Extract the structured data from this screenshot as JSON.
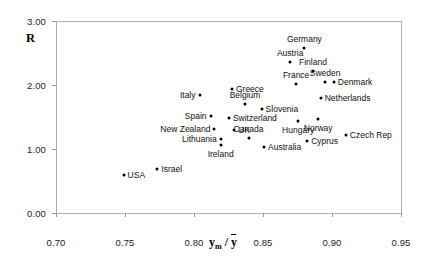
{
  "chart_data": {
    "type": "scatter",
    "title": "",
    "xlabel": "ym / ȳ",
    "ylabel": "R",
    "xlim": [
      0.7,
      0.95
    ],
    "ylim": [
      0.0,
      3.0
    ],
    "xticks": [
      "0.70",
      "0.75",
      "0.80",
      "0.85",
      "0.90",
      "0.95"
    ],
    "xtick_values": [
      0.7,
      0.75,
      0.8,
      0.85,
      0.9,
      0.95
    ],
    "yticks": [
      "0.00",
      "1.00",
      "2.00",
      "3.00"
    ],
    "ytick_values": [
      0.0,
      1.0,
      2.0,
      3.0
    ],
    "grid": false,
    "legend": "none",
    "marker": "filled-circle",
    "marker_color": "#000000",
    "frame_color": "#b0b0b0",
    "points": [
      {
        "name": "USA",
        "x": 0.749,
        "y": 0.59,
        "label_pos": "right"
      },
      {
        "name": "Israel",
        "x": 0.7735,
        "y": 0.69,
        "label_pos": "right"
      },
      {
        "name": "Italy",
        "x": 0.804,
        "y": 1.84,
        "label_pos": "left"
      },
      {
        "name": "Spain",
        "x": 0.812,
        "y": 1.51,
        "label_pos": "left"
      },
      {
        "name": "New Zealand",
        "x": 0.8148,
        "y": 1.31,
        "label_pos": "left"
      },
      {
        "name": "Lithuania",
        "x": 0.8193,
        "y": 1.15,
        "label_pos": "left"
      },
      {
        "name": "Ireland",
        "x": 0.8193,
        "y": 1.06,
        "label_pos": "below"
      },
      {
        "name": "Greece",
        "x": 0.8275,
        "y": 1.93,
        "label_pos": "right"
      },
      {
        "name": "Switzerland",
        "x": 0.8253,
        "y": 1.49,
        "label_pos": "right"
      },
      {
        "name": "UK",
        "x": 0.829,
        "y": 1.3,
        "label_pos": "right"
      },
      {
        "name": "Belgium",
        "x": 0.837,
        "y": 1.71,
        "label_pos": "above"
      },
      {
        "name": "Canada",
        "x": 0.8395,
        "y": 1.17,
        "label_pos": "above"
      },
      {
        "name": "Slovenia",
        "x": 0.849,
        "y": 1.62,
        "label_pos": "right"
      },
      {
        "name": "Australia",
        "x": 0.8508,
        "y": 1.03,
        "label_pos": "right"
      },
      {
        "name": "Austria",
        "x": 0.8697,
        "y": 2.36,
        "label_pos": "above"
      },
      {
        "name": "France",
        "x": 0.874,
        "y": 2.02,
        "label_pos": "above"
      },
      {
        "name": "Hungary",
        "x": 0.8755,
        "y": 1.44,
        "label_pos": "below"
      },
      {
        "name": "Germany",
        "x": 0.88,
        "y": 2.58,
        "label_pos": "above"
      },
      {
        "name": "Cyprus",
        "x": 0.882,
        "y": 1.12,
        "label_pos": "right"
      },
      {
        "name": "Finland",
        "x": 0.8862,
        "y": 2.22,
        "label_pos": "above"
      },
      {
        "name": "Norway",
        "x": 0.89,
        "y": 1.47,
        "label_pos": "below"
      },
      {
        "name": "Netherlands",
        "x": 0.8918,
        "y": 1.8,
        "label_pos": "right"
      },
      {
        "name": "Sweden",
        "x": 0.895,
        "y": 2.05,
        "label_pos": "above"
      },
      {
        "name": "Denmark",
        "x": 0.9013,
        "y": 2.04,
        "label_pos": "right"
      },
      {
        "name": "Czech Rep",
        "x": 0.91,
        "y": 1.22,
        "label_pos": "right"
      }
    ]
  },
  "axis": {
    "y_title": "R",
    "x_title_main": "y",
    "x_title_sub": "m",
    "x_title_sep": "/",
    "x_title_bar": "y"
  }
}
